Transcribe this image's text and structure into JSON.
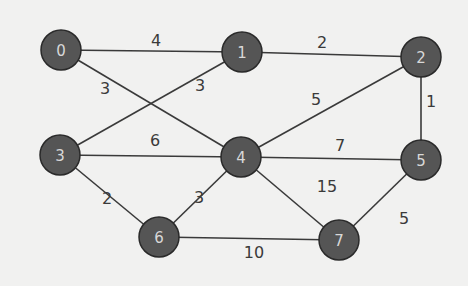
{
  "graph": {
    "type": "weighted-undirected",
    "colors": {
      "background": "#f1f1f0",
      "node_fill": "#555555",
      "node_stroke": "#2a2a2a",
      "node_text": "#d8d8d8",
      "edge": "#3a3a3a",
      "weight_text": "#3a3a3a"
    },
    "nodes": [
      {
        "id": "0",
        "label": "0",
        "x": 61,
        "y": 50
      },
      {
        "id": "1",
        "label": "1",
        "x": 242,
        "y": 52
      },
      {
        "id": "2",
        "label": "2",
        "x": 421,
        "y": 57
      },
      {
        "id": "3",
        "label": "3",
        "x": 60,
        "y": 155
      },
      {
        "id": "4",
        "label": "4",
        "x": 241,
        "y": 157
      },
      {
        "id": "5",
        "label": "5",
        "x": 421,
        "y": 160
      },
      {
        "id": "6",
        "label": "6",
        "x": 159,
        "y": 237
      },
      {
        "id": "7",
        "label": "7",
        "x": 339,
        "y": 240
      }
    ],
    "edges": [
      {
        "from": "0",
        "to": "1",
        "weight": "4",
        "lx": 156,
        "ly": 40
      },
      {
        "from": "0",
        "to": "4",
        "weight": "3",
        "lx": 105,
        "ly": 88
      },
      {
        "from": "1",
        "to": "2",
        "weight": "2",
        "lx": 322,
        "ly": 42
      },
      {
        "from": "1",
        "to": "3",
        "weight": "3",
        "lx": 200,
        "ly": 85
      },
      {
        "from": "2",
        "to": "4",
        "weight": "5",
        "lx": 316,
        "ly": 99
      },
      {
        "from": "2",
        "to": "5",
        "weight": "1",
        "lx": 431,
        "ly": 101
      },
      {
        "from": "3",
        "to": "4",
        "weight": "6",
        "lx": 155,
        "ly": 140
      },
      {
        "from": "4",
        "to": "5",
        "weight": "7",
        "lx": 340,
        "ly": 145
      },
      {
        "from": "3",
        "to": "6",
        "weight": "2",
        "lx": 107,
        "ly": 198
      },
      {
        "from": "4",
        "to": "6",
        "weight": "3",
        "lx": 199,
        "ly": 197
      },
      {
        "from": "4",
        "to": "7",
        "weight": "15",
        "lx": 327,
        "ly": 186
      },
      {
        "from": "6",
        "to": "7",
        "weight": "10",
        "lx": 254,
        "ly": 252
      },
      {
        "from": "5",
        "to": "7",
        "weight": "5",
        "lx": 404,
        "ly": 218
      }
    ]
  }
}
